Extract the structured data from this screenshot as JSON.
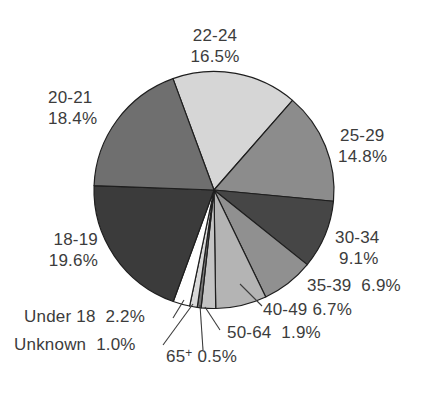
{
  "chart_data": {
    "type": "pie",
    "title": "",
    "start_angle_deg": -20,
    "direction": "clockwise",
    "categories": [
      "22-24",
      "25-29",
      "30-34",
      "35-39",
      "40-49",
      "50-64",
      "65+",
      "Unknown",
      "Under 18",
      "18-19",
      "20-21"
    ],
    "values": [
      16.5,
      14.8,
      9.1,
      6.9,
      6.7,
      1.9,
      0.5,
      1.0,
      2.2,
      19.6,
      18.4
    ],
    "value_labels": [
      "16.5%",
      "14.8%",
      "9.1%",
      "6.9%",
      "6.7%",
      "1.9%",
      "0.5%",
      "1.0%",
      "2.2%",
      "19.6%",
      "18.4%"
    ],
    "colors": [
      "#d6d6d6",
      "#8c8c8c",
      "#464646",
      "#909090",
      "#b4b4b4",
      "#c4c4c4",
      "#777777",
      "#d8d8d8",
      "#ffffff",
      "#3b3b3b",
      "#6f6f6f"
    ],
    "stroke": "#1e1e1e",
    "center": [
      214,
      190
    ],
    "radius": 120,
    "leader_lines": [
      {
        "category": "40-49",
        "from": [
          240,
          284
        ],
        "to": [
          262,
          306
        ]
      },
      {
        "category": "50-64",
        "from": [
          205,
          307
        ],
        "to": [
          220,
          330
        ]
      },
      {
        "category": "65+",
        "from": [
          200,
          305
        ],
        "to": [
          203,
          350
        ]
      },
      {
        "category": "Unknown",
        "from": [
          193,
          304
        ],
        "to": [
          163,
          345
        ]
      },
      {
        "category": "Under 18",
        "from": [
          184,
          300
        ],
        "to": [
          173,
          318
        ]
      }
    ],
    "legend": "none"
  },
  "labels": {
    "l2224": {
      "name": "22-24",
      "pct": "16.5%"
    },
    "l2529": {
      "name": "25-29",
      "pct": "14.8%"
    },
    "l3034": {
      "name": "30-34",
      "pct": "9.1%"
    },
    "l3539": {
      "name": "35-39",
      "pct": "6.9%"
    },
    "l4049": {
      "name": "40-49",
      "pct": "6.7%"
    },
    "l5064": {
      "name": "50-64",
      "pct": "1.9%"
    },
    "l65": {
      "name": "65",
      "sup": "+",
      "pct": "0.5%"
    },
    "lunk": {
      "name": "Unknown",
      "pct": "1.0%"
    },
    "lu18": {
      "name": "Under 18",
      "pct": "2.2%"
    },
    "l1819": {
      "name": "18-19",
      "pct": "19.6%"
    },
    "l2021": {
      "name": "20-21",
      "pct": "18.4%"
    }
  }
}
